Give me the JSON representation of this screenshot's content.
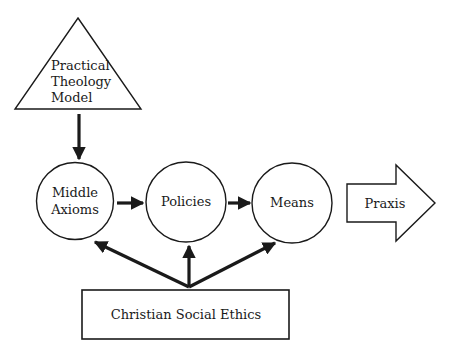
{
  "diagram": {
    "nodes": {
      "model": {
        "shape": "triangle",
        "lines": [
          "Practical",
          "Theology",
          "Model"
        ]
      },
      "middle_axioms": {
        "shape": "circle",
        "lines": [
          "Middle",
          "Axioms"
        ]
      },
      "policies": {
        "shape": "circle",
        "label": "Policies"
      },
      "means": {
        "shape": "circle",
        "label": "Means"
      },
      "praxis": {
        "shape": "block-arrow",
        "label": "Praxis"
      },
      "ethics": {
        "shape": "rectangle",
        "label": "Christian Social Ethics"
      }
    },
    "edges": [
      {
        "from": "Practical Theology Model",
        "to": "Middle Axioms"
      },
      {
        "from": "Middle Axioms",
        "to": "Policies"
      },
      {
        "from": "Policies",
        "to": "Means"
      },
      {
        "from": "Christian Social Ethics",
        "to": "Middle Axioms"
      },
      {
        "from": "Christian Social Ethics",
        "to": "Policies"
      },
      {
        "from": "Christian Social Ethics",
        "to": "Means"
      },
      {
        "from": "Means",
        "to": "Praxis"
      }
    ],
    "colors": {
      "stroke": "#1a1a1a",
      "background": "#ffffff"
    }
  }
}
